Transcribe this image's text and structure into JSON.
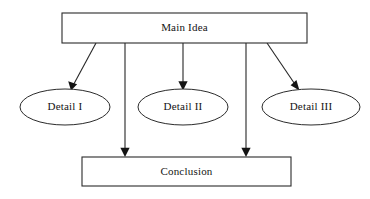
{
  "diagram": {
    "type": "flowchart",
    "canvas": {
      "width": 370,
      "height": 199,
      "background": "#ffffff"
    },
    "style": {
      "line_color": "#262626",
      "shape_fill": "#ffffff",
      "shape_stroke": "#2b2b2b",
      "text_color": "#141414"
    },
    "nodes": [
      {
        "id": "main-idea",
        "label": "Main Idea",
        "shape": "rectangle",
        "x": 62,
        "y": 13,
        "width": 245,
        "height": 30,
        "cx": 184.5,
        "cy": 28
      },
      {
        "id": "detail-1",
        "label": "Detail I",
        "shape": "ellipse",
        "cx": 65,
        "cy": 107,
        "rx": 45,
        "ry": 18
      },
      {
        "id": "detail-2",
        "label": "Detail II",
        "shape": "ellipse",
        "cx": 183,
        "cy": 107,
        "rx": 45,
        "ry": 18
      },
      {
        "id": "detail-3",
        "label": "Detail III",
        "shape": "ellipse",
        "cx": 311,
        "cy": 107,
        "rx": 49,
        "ry": 18
      },
      {
        "id": "conclusion",
        "label": "Conclusion",
        "shape": "rectangle",
        "x": 82,
        "y": 157,
        "width": 209,
        "height": 29,
        "cx": 186.5,
        "cy": 171.5
      }
    ],
    "edges": [
      {
        "id": "edge-main-to-detail1",
        "from": "main-idea",
        "to": "detail-1",
        "x1": 96,
        "y1": 43,
        "x2": 71,
        "y2": 90,
        "arrow": "end"
      },
      {
        "id": "edge-main-to-conclusion-left",
        "from": "main-idea",
        "to": "conclusion",
        "x1": 125,
        "y1": 43,
        "x2": 125,
        "y2": 156,
        "arrow": "end"
      },
      {
        "id": "edge-main-to-detail2",
        "from": "main-idea",
        "to": "detail-2",
        "x1": 183,
        "y1": 43,
        "x2": 183,
        "y2": 89,
        "arrow": "end"
      },
      {
        "id": "edge-main-to-conclusion-right",
        "from": "main-idea",
        "to": "conclusion",
        "x1": 246,
        "y1": 43,
        "x2": 246,
        "y2": 156,
        "arrow": "end"
      },
      {
        "id": "edge-main-to-detail3",
        "from": "main-idea",
        "to": "detail-3",
        "x1": 267,
        "y1": 43,
        "x2": 299,
        "y2": 90,
        "arrow": "end"
      }
    ]
  }
}
